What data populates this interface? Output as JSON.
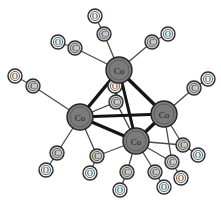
{
  "figure": {
    "background_color": "#ffffff",
    "width": 221,
    "height": 202
  },
  "style": {
    "metal_fill": "#7b7b7b",
    "metal_stroke": "#232323",
    "carbon_fill": "#c9c9c9",
    "carbon_stroke": "#2a2a2a",
    "oxygen_fill": "#f2f2f2",
    "oxygen_stroke": "#2a2a2a",
    "inner_ring_stroke": "#5a5a5a",
    "metal_bond_color": "#151515",
    "ligand_bond_color": "#4a4a4a",
    "bridge_bond_color": "#3a3a3a"
  },
  "legend": {
    "metal_symbol": "Co",
    "carbon_symbol": "C",
    "oxygen_symbol": "O"
  },
  "atoms": {
    "metals": [
      {
        "id": "co-top",
        "label": "Co",
        "x": 119,
        "y": 70,
        "r": 13
      },
      {
        "id": "co-left",
        "label": "Co",
        "x": 80,
        "y": 117,
        "r": 13
      },
      {
        "id": "co-right",
        "label": "Co",
        "x": 164,
        "y": 114,
        "r": 13
      },
      {
        "id": "co-bottom",
        "label": "Co",
        "x": 136,
        "y": 141,
        "r": 13
      }
    ],
    "carbons": [
      {
        "id": "c-top-n",
        "label": "C",
        "x": 104,
        "y": 34,
        "r": 7
      },
      {
        "id": "c-top-nw",
        "label": "C",
        "x": 75,
        "y": 48,
        "r": 7
      },
      {
        "id": "c-top-ne",
        "label": "C",
        "x": 152,
        "y": 42,
        "r": 7
      },
      {
        "id": "c-left-w",
        "label": "C",
        "x": 33,
        "y": 86,
        "r": 7
      },
      {
        "id": "c-left-sw",
        "label": "C",
        "x": 57,
        "y": 153,
        "r": 7
      },
      {
        "id": "c-left-s",
        "label": "C",
        "x": 97,
        "y": 156,
        "r": 7
      },
      {
        "id": "c-right-ne",
        "label": "C",
        "x": 194,
        "y": 88,
        "r": 7
      },
      {
        "id": "c-right-se",
        "label": "C",
        "x": 183,
        "y": 145,
        "r": 7
      },
      {
        "id": "c-right-s",
        "label": "C",
        "x": 172,
        "y": 162,
        "r": 7
      },
      {
        "id": "c-bot-sw",
        "label": "C",
        "x": 127,
        "y": 172,
        "r": 7
      },
      {
        "id": "c-bot-se",
        "label": "C",
        "x": 155,
        "y": 172,
        "r": 7
      },
      {
        "id": "c-bridge",
        "label": "C",
        "x": 116,
        "y": 102,
        "r": 7
      }
    ],
    "oxygens": [
      {
        "id": "o-top-n",
        "label": "O",
        "x": 95,
        "y": 16,
        "r": 7
      },
      {
        "id": "o-top-nw",
        "label": "O",
        "x": 58,
        "y": 42,
        "r": 7
      },
      {
        "id": "o-top-ne",
        "label": "O",
        "x": 168,
        "y": 34,
        "r": 7
      },
      {
        "id": "o-left-w",
        "label": "O",
        "x": 15,
        "y": 76,
        "r": 7
      },
      {
        "id": "o-left-sw",
        "label": "O",
        "x": 46,
        "y": 170,
        "r": 7
      },
      {
        "id": "o-left-s",
        "label": "O",
        "x": 90,
        "y": 173,
        "r": 7
      },
      {
        "id": "o-right-ne",
        "label": "O",
        "x": 208,
        "y": 79,
        "r": 7
      },
      {
        "id": "o-right-se",
        "label": "O",
        "x": 198,
        "y": 155,
        "r": 7
      },
      {
        "id": "o-right-s",
        "label": "O",
        "x": 181,
        "y": 178,
        "r": 7
      },
      {
        "id": "o-bot-sw",
        "label": "O",
        "x": 120,
        "y": 190,
        "r": 7
      },
      {
        "id": "o-bot-se",
        "label": "O",
        "x": 164,
        "y": 187,
        "r": 7
      },
      {
        "id": "o-bridge",
        "label": "O",
        "x": 115,
        "y": 86,
        "r": 7
      }
    ]
  },
  "bonds": {
    "metal_metal": [
      {
        "from": "co-top",
        "to": "co-left",
        "width": 3.4
      },
      {
        "from": "co-top",
        "to": "co-right",
        "width": 3.4
      },
      {
        "from": "co-top",
        "to": "co-bottom",
        "width": 3.0
      },
      {
        "from": "co-left",
        "to": "co-right",
        "width": 3.0
      },
      {
        "from": "co-left",
        "to": "co-bottom",
        "width": 3.4
      },
      {
        "from": "co-right",
        "to": "co-bottom",
        "width": 3.4
      }
    ],
    "metal_carbon": [
      {
        "from": "co-top",
        "to": "c-top-n"
      },
      {
        "from": "co-top",
        "to": "c-top-nw"
      },
      {
        "from": "co-top",
        "to": "c-top-ne"
      },
      {
        "from": "co-left",
        "to": "c-left-w"
      },
      {
        "from": "co-left",
        "to": "c-left-sw"
      },
      {
        "from": "co-left",
        "to": "c-left-s"
      },
      {
        "from": "co-right",
        "to": "c-right-ne"
      },
      {
        "from": "co-right",
        "to": "c-right-se"
      },
      {
        "from": "co-right",
        "to": "c-right-s"
      },
      {
        "from": "co-bottom",
        "to": "c-bot-sw"
      },
      {
        "from": "co-bottom",
        "to": "c-bot-se"
      },
      {
        "from": "co-bottom",
        "to": "c-left-s"
      },
      {
        "from": "co-bottom",
        "to": "c-right-se"
      },
      {
        "from": "co-bottom",
        "to": "c-right-s"
      }
    ],
    "bridging": [
      {
        "from": "co-left",
        "to": "c-bridge"
      },
      {
        "from": "co-top",
        "to": "c-bridge"
      },
      {
        "from": "co-bottom",
        "to": "c-bridge"
      }
    ],
    "carbon_oxygen": [
      {
        "from": "c-top-n",
        "to": "o-top-n"
      },
      {
        "from": "c-top-nw",
        "to": "o-top-nw"
      },
      {
        "from": "c-top-ne",
        "to": "o-top-ne"
      },
      {
        "from": "c-left-w",
        "to": "o-left-w"
      },
      {
        "from": "c-left-sw",
        "to": "o-left-sw"
      },
      {
        "from": "c-left-s",
        "to": "o-left-s"
      },
      {
        "from": "c-right-ne",
        "to": "o-right-ne"
      },
      {
        "from": "c-right-se",
        "to": "o-right-se"
      },
      {
        "from": "c-right-s",
        "to": "o-right-s"
      },
      {
        "from": "c-bot-sw",
        "to": "o-bot-sw"
      },
      {
        "from": "c-bot-se",
        "to": "o-bot-se"
      },
      {
        "from": "c-bridge",
        "to": "o-bridge"
      }
    ]
  }
}
